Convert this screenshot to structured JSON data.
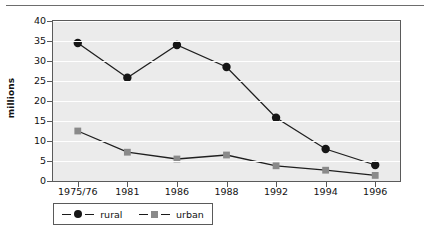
{
  "chart_data": {
    "type": "line",
    "title": "",
    "xlabel": "",
    "ylabel": "millions",
    "categories": [
      "1975/76",
      "1981",
      "1986",
      "1988",
      "1992",
      "1994",
      "1996"
    ],
    "series": [
      {
        "name": "rural",
        "values": [
          34.5,
          25.8,
          34.0,
          28.5,
          15.8,
          8.0,
          4.0
        ],
        "color": "#161616",
        "marker": "circle"
      },
      {
        "name": "urban",
        "values": [
          12.5,
          7.2,
          5.5,
          6.5,
          3.8,
          2.7,
          1.4
        ],
        "color": "#8a8a8a",
        "marker": "square"
      }
    ],
    "ylim": [
      0,
      40
    ],
    "ytick_values": [
      "0",
      "5",
      "10",
      "15",
      "20",
      "25",
      "30",
      "35",
      "40"
    ],
    "grid": true,
    "legend_position": "bottom-left",
    "plot_background": "#ebebeb",
    "gridline_color": "#ffffff",
    "axis_color": "#5a5a5a"
  },
  "legend": {
    "entries": [
      {
        "label": "rural"
      },
      {
        "label": "urban"
      }
    ]
  },
  "axes": {
    "y_title": "millions"
  }
}
